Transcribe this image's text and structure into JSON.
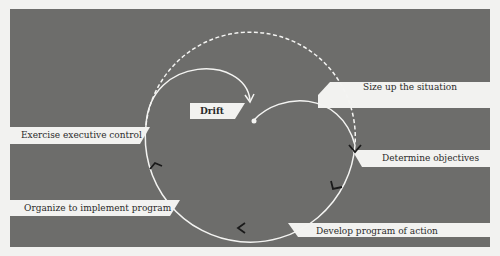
{
  "diagram": {
    "type": "management-cycle",
    "center_label": "Drift",
    "steps": [
      {
        "label": "Size up the situation"
      },
      {
        "label": "Determine objectives"
      },
      {
        "label": "Develop program of action"
      },
      {
        "label": "Organize to implement program"
      },
      {
        "label": "Exercise executive control"
      }
    ],
    "colors": {
      "background": "#6d6d6b",
      "line": "#f4f4f2",
      "label_strip": "#f2f2f0",
      "arrowhead": "#1a1a1a"
    }
  }
}
